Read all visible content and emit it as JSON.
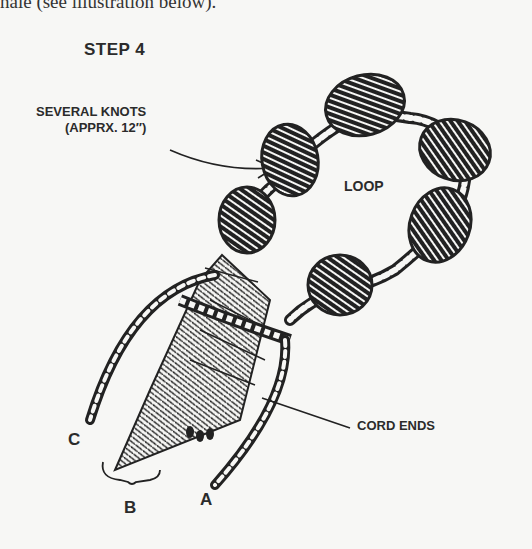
{
  "page": {
    "top_text": "nale (see illustration below).",
    "figure": {
      "step_title": "STEP 4",
      "labels": {
        "knots_line1": "SEVERAL KNOTS",
        "knots_line2": "(APPRX. 12″)",
        "loop": "LOOP",
        "cord_ends": "CORD ENDS",
        "c": "C",
        "b": "B",
        "a": "A"
      },
      "colors": {
        "ink": "#222222",
        "paper": "#f7f7f5"
      }
    }
  }
}
